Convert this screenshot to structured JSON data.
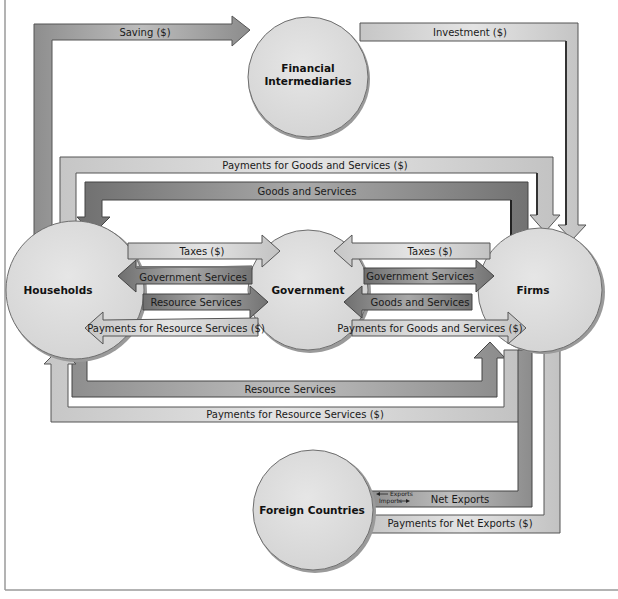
{
  "diagram": {
    "type": "circular-flow",
    "nodes": {
      "financial_intermediaries": {
        "line1": "Financial",
        "line2": "Intermediaries"
      },
      "households": "Households",
      "government": "Government",
      "firms": "Firms",
      "foreign_countries": "Foreign Countries"
    },
    "flows": {
      "saving": "Saving ($)",
      "investment": "Investment ($)",
      "payments_goods_services_top": "Payments for Goods and Services ($)",
      "goods_services_top": "Goods and Services",
      "taxes_households": "Taxes ($)",
      "gov_services_households": "Government Services",
      "resource_services_households": "Resource Services",
      "payments_resource_services_gov": "Payments for Resource Services ($)",
      "taxes_firms": "Taxes ($)",
      "gov_services_firms": "Government Services",
      "goods_services_gov": "Goods and Services",
      "payments_goods_services_gov": "Payments for Goods and Services ($)",
      "resource_services_bottom": "Resource Services",
      "payments_resource_services_bottom": "Payments for Resource Services ($)",
      "net_exports": "Net Exports",
      "exports": "Exports",
      "imports": "Imports",
      "payments_net_exports": "Payments for Net Exports ($)"
    },
    "colors": {
      "circle_fill": "#dcdcdc",
      "circle_stroke": "#6e6e6e",
      "light_band": "#d2d2d2",
      "medium_band": "#a8a8a8",
      "dark_band": "#8a8a8a",
      "edge": "#555555"
    }
  }
}
